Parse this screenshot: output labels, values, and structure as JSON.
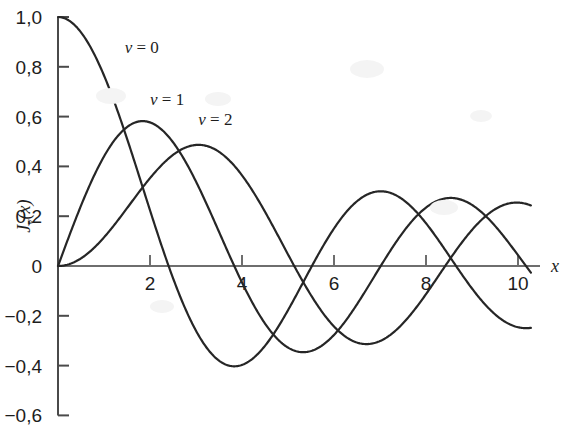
{
  "chart_data": {
    "type": "line",
    "title": "",
    "xlabel": "x",
    "ylabel": "J_v(x)",
    "ylabel_display": "J",
    "ylabel_sub": "v",
    "ylabel_tail": "(x)",
    "xlim": [
      0,
      10
    ],
    "ylim": [
      -0.6,
      1.0
    ],
    "grid": false,
    "legend_position": "inline-annotations",
    "decimal_separator": ",",
    "x_ticks": [
      2,
      4,
      6,
      8,
      10
    ],
    "x_tick_labels": [
      "2",
      "4",
      "6",
      "8",
      "10"
    ],
    "y_ticks": [
      1.0,
      0.8,
      0.6,
      0.4,
      0.2,
      0,
      -0.2,
      -0.4,
      -0.6
    ],
    "y_tick_labels": [
      "1,0",
      "0,8",
      "0,6",
      "0,4",
      "0,2",
      "0",
      "−0,2",
      "−0,4",
      "−0,6"
    ],
    "series": [
      {
        "name": "v = 0",
        "order": 0,
        "label": "ν = 0",
        "label_x": 1.45,
        "label_y": 0.855,
        "color": "#262626",
        "x": [
          0,
          0.25,
          0.5,
          0.75,
          1,
          1.25,
          1.5,
          1.75,
          2,
          2.25,
          2.5,
          2.75,
          3,
          3.25,
          3.5,
          3.75,
          4,
          4.25,
          4.5,
          4.75,
          5,
          5.25,
          5.5,
          5.75,
          6,
          6.25,
          6.5,
          6.75,
          7,
          7.25,
          7.5,
          7.75,
          8,
          8.25,
          8.5,
          8.75,
          9,
          9.25,
          9.5,
          9.75,
          10
        ],
        "values": [
          1.0,
          0.9844,
          0.9385,
          0.8642,
          0.7652,
          0.6459,
          0.5118,
          0.369,
          0.2239,
          0.0827,
          -0.0484,
          -0.1641,
          -0.2601,
          -0.3325,
          -0.3801,
          -0.4026,
          -0.3971,
          -0.3687,
          -0.3205,
          -0.2566,
          -0.1776,
          -0.0968,
          -0.0068,
          0.0726,
          0.1506,
          0.2101,
          0.2601,
          0.2931,
          0.3001,
          0.294,
          0.2663,
          0.2218,
          0.1717,
          0.1043,
          0.0419,
          -0.0193,
          -0.0903,
          -0.1423,
          -0.1939,
          -0.2243,
          -0.2459
        ],
        "key_points": {
          "zeros": [
            2.405,
            5.52,
            8.654
          ],
          "maxima": [
            {
              "x": 0,
              "y": 1.0
            },
            {
              "x": 7.016,
              "y": 0.3001
            }
          ],
          "minima": [
            {
              "x": 3.832,
              "y": -0.4028
            },
            {
              "x": 10.17,
              "y": -0.2497
            }
          ]
        }
      },
      {
        "name": "v = 1",
        "order": 1,
        "label": "ν = 1",
        "label_x": 2.0,
        "label_y": 0.645,
        "color": "#262626",
        "x": [
          0,
          0.25,
          0.5,
          0.75,
          1,
          1.25,
          1.5,
          1.75,
          2,
          2.25,
          2.5,
          2.75,
          3,
          3.25,
          3.5,
          3.75,
          4,
          4.25,
          4.5,
          4.75,
          5,
          5.25,
          5.5,
          5.75,
          6,
          6.25,
          6.5,
          6.75,
          7,
          7.25,
          7.5,
          7.75,
          8,
          8.25,
          8.5,
          8.75,
          9,
          9.25,
          9.5,
          9.75,
          10
        ],
        "values": [
          0.0,
          0.124,
          0.2423,
          0.3492,
          0.4401,
          0.5106,
          0.5579,
          0.5802,
          0.5767,
          0.5484,
          0.4971,
          0.4258,
          0.3391,
          0.2423,
          0.1374,
          0.0366,
          -0.066,
          -0.1587,
          -0.2311,
          -0.2951,
          -0.3276,
          -0.3371,
          -0.3414,
          -0.311,
          -0.2767,
          -0.2225,
          -0.1538,
          -0.0816,
          -0.0047,
          0.0613,
          0.1352,
          0.1932,
          0.2346,
          0.2617,
          0.2731,
          0.2661,
          0.2453,
          0.2116,
          0.1613,
          0.1066,
          0.0435
        ],
        "key_points": {
          "zeros": [
            0,
            3.832,
            7.016,
            10.17
          ],
          "maxima": [
            {
              "x": 1.841,
              "y": 0.5819
            },
            {
              "x": 8.536,
              "y": 0.2735
            }
          ],
          "minima": [
            {
              "x": 5.331,
              "y": -0.3461
            }
          ]
        }
      },
      {
        "name": "v = 2",
        "order": 2,
        "label": "ν = 2",
        "label_x": 3.05,
        "label_y": 0.565,
        "color": "#262626",
        "x": [
          0,
          0.25,
          0.5,
          0.75,
          1,
          1.25,
          1.5,
          1.75,
          2,
          2.25,
          2.5,
          2.75,
          3,
          3.25,
          3.5,
          3.75,
          4,
          4.25,
          4.5,
          4.75,
          5,
          5.25,
          5.5,
          5.75,
          6,
          6.25,
          6.5,
          6.75,
          7,
          7.25,
          7.5,
          7.75,
          8,
          8.25,
          8.5,
          8.75,
          9,
          9.25,
          9.5,
          9.75,
          10
        ],
        "values": [
          0.0,
          0.0078,
          0.0306,
          0.0671,
          0.1149,
          0.1711,
          0.2321,
          0.294,
          0.3528,
          0.4046,
          0.4461,
          0.4746,
          0.4861,
          0.4813,
          0.4586,
          0.4195,
          0.3641,
          0.2986,
          0.2178,
          0.1379,
          0.0466,
          -0.033,
          -0.1173,
          -0.187,
          -0.2429,
          -0.2801,
          -0.2991,
          -0.3004,
          -0.3014,
          -0.2755,
          -0.2303,
          -0.1783,
          -0.113,
          -0.0498,
          0.0184,
          0.0797,
          0.1448,
          0.1916,
          0.2235,
          0.2504,
          0.2546
        ],
        "key_points": {
          "zeros": [
            0,
            5.136,
            8.417
          ],
          "maxima": [
            {
              "x": 3.054,
              "y": 0.4865
            },
            {
              "x": 9.969,
              "y": 0.2546
            }
          ],
          "minima": [
            {
              "x": 6.706,
              "y": -0.3013
            }
          ]
        }
      }
    ]
  },
  "axes": {
    "x_axis_label": "x",
    "y_axis_label_parts": [
      "J",
      "ν",
      "(x)"
    ],
    "axis_color": "#6e6e6e",
    "y_axis_color": "#4a4a4a",
    "curve_color": "#262626",
    "text_color": "#1d1d1d",
    "background_color": "#ffffff"
  }
}
